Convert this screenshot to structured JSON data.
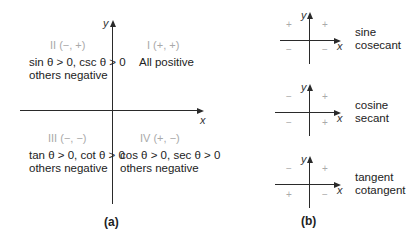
{
  "panel_a": {
    "caption": "(a)",
    "axes": {
      "x_label": "x",
      "y_label": "y"
    },
    "quadrants": [
      {
        "id": "II",
        "title": "II (−, +)",
        "line1": "sin θ > 0, csc θ > 0",
        "line2": "others negative"
      },
      {
        "id": "I",
        "title": "I (+, +)",
        "line1": "All positive",
        "line2": ""
      },
      {
        "id": "III",
        "title": "III (−, −)",
        "line1": "tan θ > 0, cot θ > 0",
        "line2": "others negative"
      },
      {
        "id": "IV",
        "title": "IV (+, −)",
        "line1": "cos θ > 0, sec θ > 0",
        "line2": "others negative"
      }
    ]
  },
  "panel_b": {
    "caption": "(b)",
    "diagrams": [
      {
        "x_label": "x",
        "y_label": "y",
        "signs": {
          "q1": "+",
          "q2": "+",
          "q3": "−",
          "q4": "−"
        },
        "functions": [
          "sine",
          "cosecant"
        ]
      },
      {
        "x_label": "x",
        "y_label": "y",
        "signs": {
          "q1": "+",
          "q2": "−",
          "q3": "−",
          "q4": "+"
        },
        "functions": [
          "cosine",
          "secant"
        ]
      },
      {
        "x_label": "x",
        "y_label": "y",
        "signs": {
          "q1": "+",
          "q2": "−",
          "q3": "+",
          "q4": "−"
        },
        "functions": [
          "tangent",
          "cotangent"
        ]
      }
    ]
  }
}
